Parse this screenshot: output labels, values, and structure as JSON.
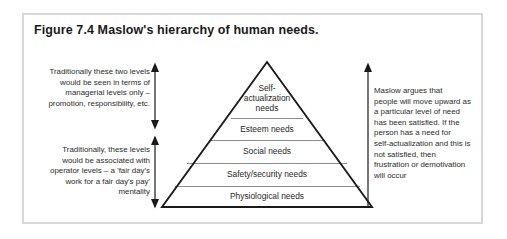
{
  "figure": {
    "title": "Figure 7.4 Maslow's hierarchy of human needs.",
    "border_color": "#d8d8da",
    "background": "#ffffff",
    "outline_color": "#1a1a1a",
    "divider_color": "#8c8c8c",
    "text_color": "#2b2b2b"
  },
  "annotations": {
    "left_top": {
      "align": "right",
      "lines": [
        "Traditionally these two levels",
        "would be seen in terms of",
        "managerial levels only –",
        "promotion, responsibility, etc."
      ]
    },
    "left_bottom": {
      "align": "right",
      "lines": [
        "Traditionally, these levels",
        "would be associated with",
        "operator levels – a 'fair day's",
        "work for a fair day's pay'",
        "mentality"
      ]
    },
    "right": {
      "align": "left",
      "lines": [
        "Maslow argues that",
        "people will move upward as",
        "a particular level of need",
        "has been satisfied. If the",
        "person has a need for",
        "self-actualization and this is",
        "not satisfied, then",
        "frustration or demotivation",
        "will occur"
      ]
    }
  },
  "arrows": {
    "left_upper": {
      "name": "double-headed-arrow-managerial-levels",
      "direction": "both"
    },
    "left_lower": {
      "name": "double-headed-arrow-operator-levels",
      "direction": "both"
    },
    "right": {
      "name": "upward-arrow-progression",
      "direction": "up"
    }
  },
  "pyramid": {
    "name": "maslow-hierarchy-pyramid",
    "apex_label_lines": [
      "Self-",
      "actualization",
      "needs"
    ],
    "tiers": [
      {
        "level": 5,
        "label": "Self-actualization needs"
      },
      {
        "level": 4,
        "label": "Esteem needs"
      },
      {
        "level": 3,
        "label": "Social needs"
      },
      {
        "level": 2,
        "label": "Safety/security needs"
      },
      {
        "level": 1,
        "label": "Physiological needs"
      }
    ]
  },
  "tier_labels": {
    "t5_l1": "Self-",
    "t5_l2": "actualization",
    "t5_l3": "needs",
    "t4": "Esteem needs",
    "t3": "Social needs",
    "t2": "Safety/security needs",
    "t1": "Physiological needs"
  }
}
